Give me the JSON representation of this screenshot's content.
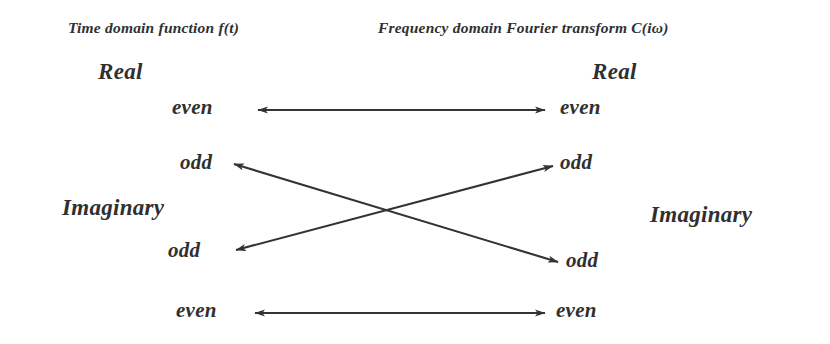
{
  "figure": {
    "background_color": "#ffffff",
    "ink_color": "#303030",
    "arrow_color": "#333333"
  },
  "headers": {
    "left": "Time domain function f(t)",
    "right": "Frequency domain Fourier transform C(iω)"
  },
  "left_column": {
    "real_label": "Real",
    "imaginary_label": "Imaginary",
    "even_top": "even",
    "odd_upper": "odd",
    "odd_lower": "odd",
    "even_bottom": "even"
  },
  "right_column": {
    "real_label": "Real",
    "imaginary_label": "Imaginary",
    "even_top": "even",
    "odd_upper": "odd",
    "odd_lower": "odd",
    "even_bottom": "even"
  },
  "connections": [
    {
      "name": "real-even-to-real-even",
      "from": "left real even",
      "to": "right real even",
      "style": "double-headed-horizontal"
    },
    {
      "name": "real-odd-to-imaginary-odd",
      "from": "left real odd",
      "to": "right imaginary odd",
      "style": "double-headed-diagonal"
    },
    {
      "name": "imaginary-odd-to-real-odd",
      "from": "left imaginary odd",
      "to": "right real odd",
      "style": "double-headed-diagonal"
    },
    {
      "name": "imaginary-even-to-imaginary-even",
      "from": "left imaginary even",
      "to": "right imaginary even",
      "style": "double-headed-horizontal"
    }
  ]
}
